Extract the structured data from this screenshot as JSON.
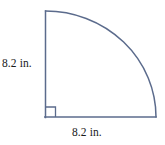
{
  "figure": {
    "shape_type": "quarter-circle-sector",
    "background_color": "#ffffff",
    "stroke_color": "#5b6b8c",
    "stroke_width": 1.4,
    "text_color": "#1a1a1a",
    "geometry": {
      "corner_x": 45,
      "corner_y": 117,
      "top_x": 45,
      "top_y": 11,
      "right_x": 156,
      "right_y": 117,
      "vertical_radius_px": 106,
      "horizontal_radius_px": 111,
      "right_angle_marker_size_px": 10
    },
    "labels": {
      "vertical_side": "8.2 in.",
      "horizontal_side": "8.2 in."
    },
    "measurements": {
      "radius_value": "8.2",
      "radius_unit": "in."
    }
  }
}
